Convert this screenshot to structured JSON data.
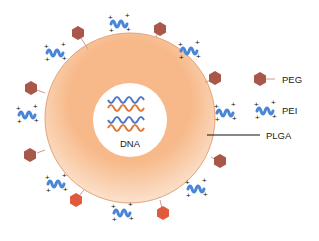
{
  "diagram": {
    "type": "nanoparticle-schematic",
    "core_label": "DNA",
    "shell_label": "PLGA",
    "legend": [
      {
        "label": "PEG",
        "icon": "hexagon-stalk-icon"
      },
      {
        "label": "PEI",
        "icon": "coil-plus-charges-icon"
      }
    ],
    "colors": {
      "shell": "#f7b98a",
      "shell_edge": "#e3a278",
      "core": "#ffffff",
      "peg": "#a8574a",
      "peg_bright": "#e05a3c",
      "pei": "#4a86d6",
      "dna_blue": "#5078c8",
      "dna_orange": "#e07a3a",
      "text": "#222222",
      "leader_line": "#111111"
    }
  }
}
